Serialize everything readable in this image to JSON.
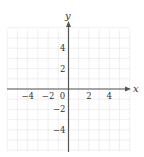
{
  "figure": {
    "type": "coordinate-grid",
    "x_axis_label": "x",
    "y_axis_label": "y",
    "x_range": [
      -6,
      6
    ],
    "y_range": [
      -6,
      6
    ],
    "grid_step": 1,
    "x_tick_labels": [
      {
        "value": -4,
        "text": "−4"
      },
      {
        "value": -2,
        "text": "−2"
      },
      {
        "value": 0,
        "text": "0"
      },
      {
        "value": 2,
        "text": "2"
      },
      {
        "value": 4,
        "text": "4"
      }
    ],
    "y_tick_labels": [
      {
        "value": 4,
        "text": "4"
      },
      {
        "value": 2,
        "text": "2"
      },
      {
        "value": -2,
        "text": "−2"
      },
      {
        "value": -4,
        "text": "−4"
      }
    ],
    "colors": {
      "grid": "#cfcfcf",
      "axis": "#555555",
      "text": "#333333"
    }
  }
}
